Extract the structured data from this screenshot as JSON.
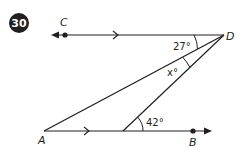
{
  "problem": {
    "number": "30",
    "badge_color": "#231f20"
  },
  "diagram": {
    "points": {
      "A": "A",
      "B": "B",
      "C": "C",
      "D": "D"
    },
    "angles": {
      "top": "27°",
      "middle": "x°",
      "bottom": "42°"
    },
    "line_color": "#231f20",
    "parallel_marks": "single arrow on line CD and line AB"
  }
}
